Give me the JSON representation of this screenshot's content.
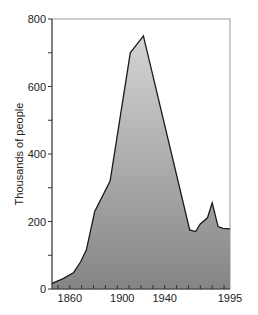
{
  "chart_data": {
    "type": "area",
    "title": "",
    "xlabel": "",
    "ylabel": "Thousands of people",
    "xlim": [
      1845,
      1995
    ],
    "ylim": [
      0,
      800
    ],
    "x_ticks_labeled": [
      1860,
      1900,
      1940,
      1995
    ],
    "x_tick_labels": [
      "1860",
      "1900",
      "1940",
      "1995"
    ],
    "x_minor_tick_step": 10,
    "y_ticks": [
      0,
      200,
      400,
      600,
      800
    ],
    "y_tick_labels": [
      "0",
      "200",
      "400",
      "600",
      "800"
    ],
    "y_minor_ticks": [
      100,
      300,
      500,
      700
    ],
    "grid": false,
    "legend": null,
    "x": [
      1845,
      1846,
      1854,
      1863,
      1869,
      1874,
      1881,
      1894,
      1911,
      1922,
      1961,
      1966,
      1970,
      1976,
      1980,
      1985,
      1989,
      1995
    ],
    "values": [
      15,
      18,
      30,
      48,
      80,
      116,
      230,
      320,
      700,
      750,
      175,
      170,
      193,
      211,
      255,
      185,
      180,
      178
    ],
    "colors": {
      "fill_top": "#d4d4d4",
      "fill_bottom": "#858585",
      "line": "#1a1a1a",
      "frame": "#9a9a9a",
      "axis": "#333333"
    }
  }
}
